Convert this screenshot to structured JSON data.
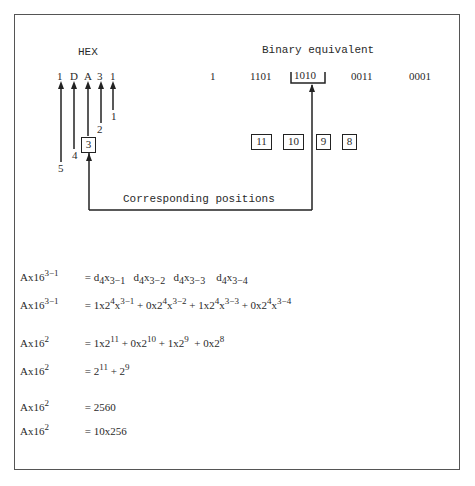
{
  "header": {
    "hex_label": "HEX",
    "binary_label": "Binary equivalent"
  },
  "hex_digits": [
    "1",
    "D",
    "A",
    "3",
    "1"
  ],
  "binary_leading": "1",
  "binary_groups": [
    "1101",
    "1010",
    "0011",
    "0001"
  ],
  "position_labels": [
    "5",
    "4",
    "3",
    "2",
    "1"
  ],
  "bit_positions": [
    "11",
    "10",
    "9",
    "8"
  ],
  "connector_label": "Corresponding positions",
  "equations": [
    {
      "lhs": "Ax16",
      "lhs_exp": "3−1",
      "rhs_parts": [
        {
          "base": "d",
          "sub1": "4",
          "mid": "x",
          "sub2": "3−1"
        },
        {
          "base": "d",
          "sub1": "4",
          "mid": "x",
          "sub2": "3−2"
        },
        {
          "base": "d",
          "sub1": "4",
          "mid": "x",
          "sub2": "3−3"
        },
        {
          "base": "d",
          "sub1": "4",
          "mid": "x",
          "sub2": "3−4"
        }
      ]
    },
    {
      "lhs": "Ax16",
      "lhs_exp": "3−1",
      "rhs_text": "1x2^4x^3-1 + 0x2^4x^3-2 + 1x2^4x^3-3 + 0x2^4x^3-4"
    },
    {
      "lhs": "Ax16",
      "lhs_exp": "2",
      "rhs_text": "1x2^11 + 0x2^10 + 1x2^9 + 0x2^8"
    },
    {
      "lhs": "Ax16",
      "lhs_exp": "2",
      "rhs_text": "2^11 + 2^9"
    },
    {
      "lhs": "Ax16",
      "lhs_exp": "2",
      "rhs_text": "2560"
    },
    {
      "lhs": "Ax16",
      "lhs_exp": "2",
      "rhs_text": "10x256"
    }
  ],
  "eq_strings": {
    "e2": {
      "t1": "1x2",
      "e1": "4",
      "t2": "x",
      "e2": "3−1",
      "t3": "+ 0x2",
      "e3": "4",
      "t4": "x",
      "e4": "3−2",
      "t5": " + 1x2",
      "e5": "4",
      "t6": "x",
      "e6": "3−3",
      "t7": "+ 0x2",
      "e7": "4",
      "t8": "x",
      "e8": "3−4"
    },
    "e3": {
      "t1": "1x2",
      "e1": "11",
      "t2": " + 0x2",
      "e2": "10",
      "t3": " + 1x2",
      "e3": "9",
      "t4": "  + 0x2",
      "e4": "8"
    },
    "e4": {
      "t1": "2",
      "e1": "11",
      "t2": " + 2",
      "e2": "9"
    },
    "e5": {
      "t1": "2560"
    },
    "e6": {
      "t1": "10x256"
    },
    "eq": "=",
    "lhs": "Ax16",
    "exp31": "3−1",
    "exp2": "2",
    "d": "d",
    "x": "x",
    "s4": "4",
    "s31": "3−1",
    "s32": "3−2",
    "s33": "3−3",
    "s34": "3−4"
  }
}
